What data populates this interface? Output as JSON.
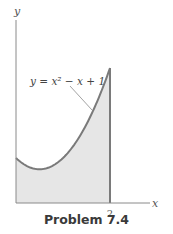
{
  "chart_data": {
    "type": "area",
    "title": "",
    "function": "y = x^2 - x + 1",
    "curve_label": "y = x² − x + 1",
    "x_domain": [
      0,
      2
    ],
    "xlabel": "x",
    "ylabel": "y",
    "xlim": [
      0,
      2.9
    ],
    "ylim": [
      0,
      4.3
    ],
    "x_ticks": [
      {
        "value": 2,
        "label": "2"
      }
    ],
    "shaded_region": {
      "from": 0,
      "to": 2,
      "under": "curve"
    },
    "grid": false,
    "colors": {
      "curve": "#7a7a7a",
      "fill": "#e6e6e6",
      "axis": "#8a8a8a"
    }
  },
  "caption": "Problem 7.4"
}
